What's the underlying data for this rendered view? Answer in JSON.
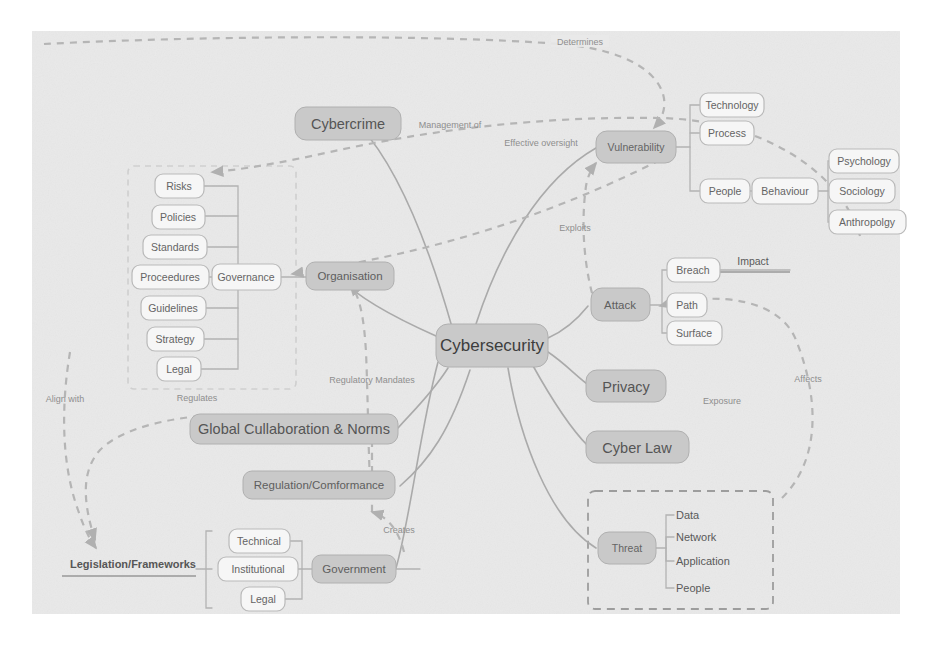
{
  "diagram": {
    "title": "Cybersecurity",
    "canvas": {
      "background_color": "#e9e9e9",
      "page_color": "#ffffff"
    },
    "palette": {
      "node_dark": "#c9c9c9",
      "node_light": "#efefef",
      "edge": "#aaaaaa",
      "dashed_edge": "#b5b5b5",
      "text": "#5e5e5e"
    }
  },
  "central": {
    "label": "Cybersecurity"
  },
  "branches": {
    "cybercrime": {
      "label": "Cybercrime"
    },
    "organisation": {
      "label": "Organisation"
    },
    "governance": {
      "label": "Governance"
    },
    "vulnerability": {
      "label": "Vulnerability"
    },
    "attack": {
      "label": "Attack"
    },
    "privacy": {
      "label": "Privacy"
    },
    "cyber_law": {
      "label": "Cyber Law"
    },
    "threat": {
      "label": "Threat"
    },
    "global_collaboration": {
      "label": "Global Cullaboration & Norms"
    },
    "regulation": {
      "label": "Regulation/Comformance"
    },
    "government": {
      "label": "Government"
    },
    "legislation": {
      "label": "Legislation/Frameworks"
    },
    "behaviour": {
      "label": "Behaviour"
    },
    "impact": {
      "label": "Impact"
    }
  },
  "governance_items": [
    {
      "label": "Risks"
    },
    {
      "label": "Policies"
    },
    {
      "label": "Standards"
    },
    {
      "label": "Proceedures"
    },
    {
      "label": "Guidelines"
    },
    {
      "label": "Strategy"
    },
    {
      "label": "Legal"
    }
  ],
  "vulnerability_items": [
    {
      "label": "Technology"
    },
    {
      "label": "Process"
    },
    {
      "label": "People"
    }
  ],
  "behaviour_items": [
    {
      "label": "Psychology"
    },
    {
      "label": "Sociology"
    },
    {
      "label": "Anthropolgy"
    }
  ],
  "attack_items": [
    {
      "label": "Breach"
    },
    {
      "label": "Path"
    },
    {
      "label": "Surface"
    }
  ],
  "threat_items": [
    {
      "label": "Data"
    },
    {
      "label": "Network"
    },
    {
      "label": "Application"
    },
    {
      "label": "People"
    }
  ],
  "government_items": [
    {
      "label": "Technical"
    },
    {
      "label": "Institutional"
    },
    {
      "label": "Legal"
    }
  ],
  "edge_labels": {
    "determines": "Determines",
    "management_of": "Management of",
    "effective_oversight": "Effective oversight",
    "exploits": "Exploits",
    "affects": "Affects",
    "exposure": "Exposure",
    "regulatory_mandates": "Regulatory Mandates",
    "regulates": "Regulates",
    "align_with": "Align with",
    "creates": "Creates"
  }
}
